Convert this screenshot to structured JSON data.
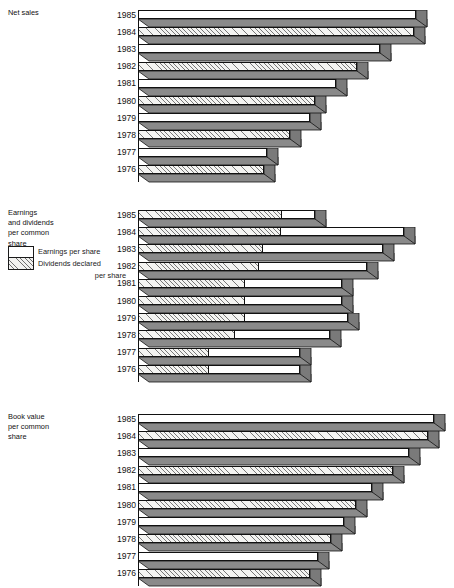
{
  "figure": {
    "type": "grouped-3d-horizontal-bar-panels",
    "axis_x_px": 138,
    "panels": [
      {
        "id": "net-sales",
        "caption_lines": [
          "Net sales"
        ],
        "years": [
          "1985",
          "1984",
          "1983",
          "1982",
          "1981",
          "1980",
          "1979",
          "1978",
          "1977",
          "1976"
        ],
        "bar_lengths_px": [
          278,
          276,
          242,
          219,
          198,
          177,
          172,
          152,
          129,
          126
        ],
        "fills": [
          "white",
          "hatched",
          "white",
          "hatched",
          "white",
          "hatched",
          "white",
          "hatched",
          "white",
          "hatched"
        ],
        "has_legend": false
      },
      {
        "id": "earnings-and-dividends",
        "caption_lines": [
          "Earnings",
          "and dividends",
          "per common",
          "share"
        ],
        "legend": {
          "items": [
            {
              "label": "Earnings per share",
              "swatch": "white"
            },
            {
              "label": "Dividends declared",
              "label2": "per share",
              "swatch": "hatched"
            }
          ]
        },
        "years": [
          "1985",
          "1984",
          "1983",
          "1982",
          "1981",
          "1980",
          "1979",
          "1978",
          "1977",
          "1976"
        ],
        "dividend_lengths_px": [
          144,
          143,
          125,
          121,
          107,
          107,
          107,
          97,
          71,
          71
        ],
        "total_lengths_px": [
          177,
          266,
          245,
          229,
          204,
          204,
          210,
          192,
          162,
          162
        ],
        "has_legend": true
      },
      {
        "id": "book-value",
        "caption_lines": [
          "Book value",
          "per common",
          "share"
        ],
        "years": [
          "1985",
          "1984",
          "1983",
          "1982",
          "1981",
          "1980",
          "1979",
          "1978",
          "1977",
          "1976"
        ],
        "bar_lengths_px": [
          296,
          290,
          271,
          255,
          234,
          218,
          206,
          193,
          180,
          172
        ],
        "fills": [
          "white",
          "hatched",
          "white",
          "hatched",
          "white",
          "hatched",
          "white",
          "hatched",
          "white",
          "hatched"
        ],
        "has_legend": false
      }
    ]
  },
  "chart_data": {
    "type": "bar",
    "title": "",
    "orientation": "horizontal",
    "style": "3d-extruded-horizontal-bars, alternating white / diagonal-hatch fills, grey drop-shadow extrusion",
    "grid": false,
    "legend_position": "upper-left (panel 2 only)",
    "categories": [
      "1985",
      "1984",
      "1983",
      "1982",
      "1981",
      "1980",
      "1979",
      "1978",
      "1977",
      "1976"
    ],
    "xlabel": "",
    "ylabel": "",
    "panels": [
      {
        "name": "Net sales",
        "type": "bar",
        "categories": [
          "1985",
          "1984",
          "1983",
          "1982",
          "1981",
          "1980",
          "1979",
          "1978",
          "1977",
          "1976"
        ],
        "values": [
          278,
          276,
          242,
          219,
          198,
          177,
          172,
          152,
          129,
          126
        ],
        "units": "relative bar length (px, axis unlabeled)"
      },
      {
        "name": "Earnings and dividends per common share",
        "type": "bar",
        "stacked": true,
        "categories": [
          "1985",
          "1984",
          "1983",
          "1982",
          "1181",
          "1980",
          "1979",
          "1978",
          "1977",
          "1976"
        ],
        "series": [
          {
            "name": "Dividends declared per share",
            "values": [
              144,
              143,
              125,
              121,
              107,
              107,
              107,
              97,
              71,
              71
            ]
          },
          {
            "name": "Earnings per share",
            "values": [
              33,
              123,
              120,
              108,
              97,
              97,
              103,
              95,
              91,
              91
            ]
          }
        ],
        "totals": [
          177,
          266,
          245,
          229,
          204,
          204,
          210,
          192,
          162,
          162
        ],
        "units": "relative bar length (px, axis unlabeled)"
      },
      {
        "name": "Book value per common share",
        "type": "bar",
        "categories": [
          "1985",
          "1984",
          "1983",
          "1982",
          "1981",
          "1980",
          "1979",
          "1978",
          "1977",
          "1976"
        ],
        "values": [
          296,
          290,
          271,
          255,
          234,
          218,
          206,
          193,
          180,
          172
        ],
        "units": "relative bar length (px, axis unlabeled)"
      }
    ]
  }
}
